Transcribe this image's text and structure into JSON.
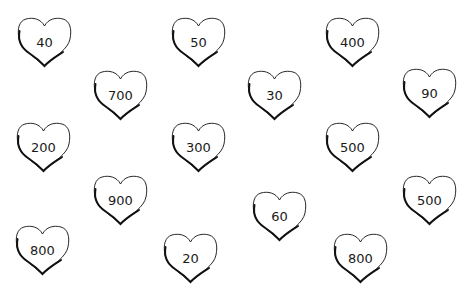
{
  "hearts": [
    {
      "value": "40"
    },
    {
      "value": "50"
    },
    {
      "value": "400"
    },
    {
      "value": "700"
    },
    {
      "value": "30"
    },
    {
      "value": "90"
    },
    {
      "value": "200"
    },
    {
      "value": "300"
    },
    {
      "value": "500"
    },
    {
      "value": "900"
    },
    {
      "value": "60"
    },
    {
      "value": "500"
    },
    {
      "value": "800"
    },
    {
      "value": "20"
    },
    {
      "value": "800"
    }
  ],
  "colors": {
    "outline": "#111111",
    "background": "#ffffff"
  }
}
